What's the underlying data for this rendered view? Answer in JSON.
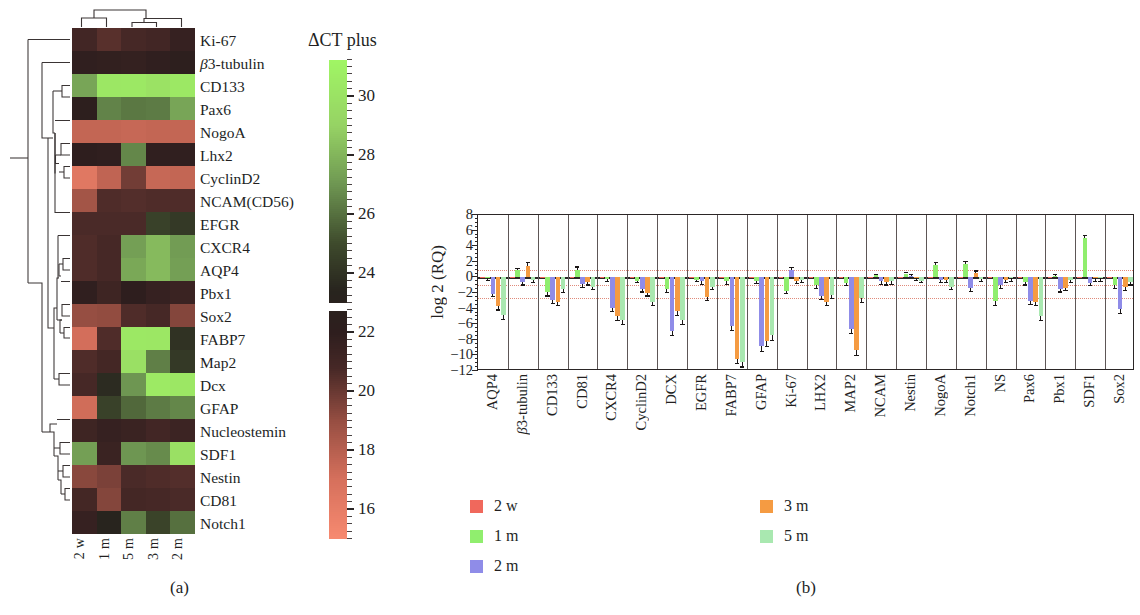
{
  "figure": {
    "panel_a_caption": "(a)",
    "panel_b_caption": "(b)"
  },
  "panel_a": {
    "colorbar_title": "ΔCT plus",
    "colorbar_ticks": [
      30,
      28,
      26,
      24,
      22,
      20,
      18,
      16
    ],
    "colorbar_range": [
      15.0,
      31.2
    ],
    "colorbar_gap": [
      22.7,
      23.0
    ],
    "column_labels": [
      "2 w",
      "1 m",
      "5 m",
      "3 m",
      "2 m"
    ],
    "row_labels": [
      "Ki-67",
      "β3-tubulin",
      "CD133",
      "Pax6",
      "NogoA",
      "Lhx2",
      "CyclinD2",
      "NCAM(CD56)",
      "EFGR",
      "CXCR4",
      "AQP4",
      "Pbx1",
      "Sox2",
      "FABP7",
      "Map2",
      "Dcx",
      "GFAP",
      "Nucleostemin",
      "SDF1",
      "Nestin",
      "CD81",
      "Notch1"
    ],
    "heatmap_values": [
      [
        21.0,
        20.4,
        20.8,
        21.0,
        21.6
      ],
      [
        21.9,
        21.8,
        21.7,
        21.9,
        22.2
      ],
      [
        27.5,
        30.3,
        30.4,
        30.0,
        30.4
      ],
      [
        22.3,
        26.5,
        26.2,
        26.3,
        27.5
      ],
      [
        17.6,
        17.6,
        17.5,
        17.6,
        17.6
      ],
      [
        22.0,
        21.9,
        26.6,
        21.9,
        21.9
      ],
      [
        16.4,
        17.7,
        19.8,
        17.5,
        17.6
      ],
      [
        18.6,
        20.6,
        20.5,
        20.6,
        20.6
      ],
      [
        20.7,
        20.7,
        20.7,
        24.6,
        24.3
      ],
      [
        20.6,
        20.8,
        27.3,
        28.2,
        27.2
      ],
      [
        20.6,
        20.8,
        27.6,
        28.2,
        27.3
      ],
      [
        21.9,
        21.2,
        22.0,
        21.6,
        21.4
      ],
      [
        19.0,
        19.1,
        20.6,
        20.8,
        19.4
      ],
      [
        17.1,
        20.6,
        30.4,
        30.3,
        24.0
      ],
      [
        20.6,
        20.9,
        29.9,
        26.4,
        24.3
      ],
      [
        20.8,
        23.7,
        27.0,
        30.5,
        30.3
      ],
      [
        17.2,
        24.6,
        25.8,
        26.3,
        26.6
      ],
      [
        21.2,
        21.6,
        21.4,
        21.0,
        21.3
      ],
      [
        27.3,
        21.4,
        27.0,
        26.7,
        29.9
      ],
      [
        19.3,
        19.6,
        20.7,
        20.6,
        20.5
      ],
      [
        20.9,
        19.4,
        20.9,
        20.8,
        20.7
      ],
      [
        21.6,
        23.3,
        26.4,
        24.7,
        26.0
      ]
    ]
  },
  "chart_data": {
    "type": "bar",
    "title": "",
    "xlabel": "",
    "ylabel": "log 2 (RQ)",
    "ylim": [
      -12,
      8
    ],
    "yticks": [
      8,
      6,
      4,
      2,
      0,
      -2,
      -4,
      -6,
      -8,
      -10,
      -12
    ],
    "grid": false,
    "legend_position": "bottom",
    "categories": [
      "AQP4",
      "β3-tubulin",
      "CD133",
      "CD81",
      "CXCR4",
      "CyclinD2",
      "DCX",
      "EGFR",
      "FABP7",
      "GFAP",
      "Ki-67",
      "LHX2",
      "MAP2",
      "NCAM",
      "Nestin",
      "NogoA",
      "Notch1",
      "NS",
      "Pax6",
      "Pbx1",
      "SDF1",
      "Sox2"
    ],
    "series": [
      {
        "name": "2 w",
        "color": "#f0685c",
        "values": [
          0.0,
          0.0,
          0.0,
          0.0,
          0.0,
          0.0,
          0.0,
          0.0,
          0.0,
          0.0,
          0.0,
          0.0,
          0.0,
          0.0,
          0.0,
          0.0,
          0.0,
          0.0,
          0.0,
          0.0,
          0.0,
          0.0
        ],
        "errors": [
          0.0,
          0.0,
          0.0,
          0.0,
          0.0,
          0.0,
          0.0,
          0.0,
          0.0,
          0.0,
          0.0,
          0.0,
          0.0,
          0.0,
          0.0,
          0.0,
          0.0,
          0.0,
          0.0,
          0.0,
          0.0,
          0.0
        ]
      },
      {
        "name": "1 m",
        "color": "#90ee6e",
        "values": [
          -0.1,
          0.9,
          -1.9,
          1.0,
          -0.2,
          -0.4,
          -1.5,
          -0.3,
          -0.5,
          -0.4,
          -1.7,
          -1.0,
          -0.7,
          0.3,
          0.5,
          1.6,
          1.7,
          -3.0,
          -0.6,
          0.2,
          5.0,
          -1.0
        ],
        "errors": [
          0.2,
          0.3,
          0.4,
          0.4,
          0.2,
          0.2,
          0.4,
          0.2,
          0.3,
          0.3,
          0.3,
          0.3,
          0.3,
          0.2,
          0.2,
          0.4,
          0.4,
          0.5,
          0.3,
          0.2,
          0.5,
          0.3
        ]
      },
      {
        "name": "2 m",
        "color": "#8f8ce8",
        "values": [
          -2.1,
          -0.6,
          -2.9,
          -0.9,
          -3.9,
          -1.5,
          -6.9,
          -0.5,
          -6.2,
          -8.8,
          1.0,
          -2.4,
          -6.6,
          -0.5,
          0.2,
          -0.3,
          -1.4,
          -1.0,
          -3.0,
          -1.5,
          -0.7,
          -4.1
        ],
        "errors": [
          0.3,
          0.3,
          0.4,
          0.3,
          0.4,
          0.3,
          0.5,
          0.3,
          0.5,
          0.6,
          0.3,
          0.4,
          0.5,
          0.3,
          0.2,
          0.3,
          0.3,
          0.3,
          0.4,
          0.3,
          0.3,
          0.5
        ]
      },
      {
        "name": "3 m",
        "color": "#f59b42",
        "values": [
          -3.7,
          1.5,
          -3.1,
          -0.6,
          -4.9,
          -2.0,
          -4.3,
          -2.5,
          -10.4,
          -8.2,
          -0.4,
          -3.1,
          -9.3,
          -0.6,
          -0.1,
          -0.3,
          0.6,
          -0.3,
          -3.1,
          -1.3,
          -0.1,
          -1.2
        ],
        "errors": [
          0.4,
          0.5,
          0.4,
          0.3,
          0.5,
          0.3,
          0.5,
          0.4,
          0.6,
          0.6,
          0.3,
          0.4,
          0.6,
          0.3,
          0.2,
          0.3,
          0.3,
          0.3,
          0.4,
          0.3,
          0.3,
          0.4
        ]
      },
      {
        "name": "5 m",
        "color": "#a9e8b0",
        "values": [
          -4.8,
          -0.3,
          -1.5,
          -1.2,
          -5.5,
          -3.1,
          -5.5,
          -1.2,
          -10.8,
          -7.4,
          -0.3,
          -2.2,
          -2.7,
          -0.5,
          -0.4,
          -1.2,
          -0.2,
          -0.1,
          -5.0,
          -0.3,
          -0.1,
          -0.6
        ],
        "errors": [
          0.5,
          0.3,
          0.4,
          0.3,
          0.5,
          0.4,
          0.5,
          0.3,
          0.6,
          0.6,
          0.3,
          0.4,
          0.4,
          0.3,
          0.2,
          0.3,
          0.3,
          0.3,
          0.5,
          0.3,
          0.3,
          0.3
        ]
      }
    ],
    "legend": [
      {
        "label": "2 w",
        "color": "#f0685c"
      },
      {
        "label": "1 m",
        "color": "#90ee6e"
      },
      {
        "label": "2 m",
        "color": "#8f8ce8"
      },
      {
        "label": "3 m",
        "color": "#f59b42"
      },
      {
        "label": "5 m",
        "color": "#a9e8b0"
      }
    ]
  }
}
